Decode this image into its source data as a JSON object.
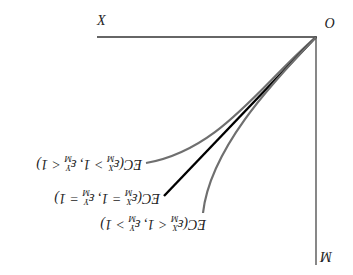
{
  "diagram": {
    "orientation_note": "rendered rotated 180 degrees",
    "axes": {
      "origin_label": "O",
      "horizontal_label": "X",
      "vertical_label": "M"
    },
    "curves": [
      {
        "id": "upper",
        "label_prefix": "EC(",
        "eps1_sup": "X",
        "eps1_sub": "M",
        "rel1": " > 1, ",
        "eps2_sup": "Y",
        "eps2_sub": "M",
        "rel2": " < 1)",
        "color": "#6f6f6f",
        "style": "curve"
      },
      {
        "id": "middle",
        "label_prefix": "EC(",
        "eps1_sup": "X",
        "eps1_sub": "M",
        "rel1": " = 1, ",
        "eps2_sup": "Y",
        "eps2_sub": "M",
        "rel2": " = 1)",
        "color": "#000000",
        "style": "straight"
      },
      {
        "id": "lower",
        "label_prefix": "EC(",
        "eps1_sup": "X",
        "eps1_sub": "M",
        "rel1": " < 1, ",
        "eps2_sup": "Y",
        "eps2_sub": "M",
        "rel2": " > 1)",
        "color": "#6f6f6f",
        "style": "curve"
      }
    ]
  }
}
